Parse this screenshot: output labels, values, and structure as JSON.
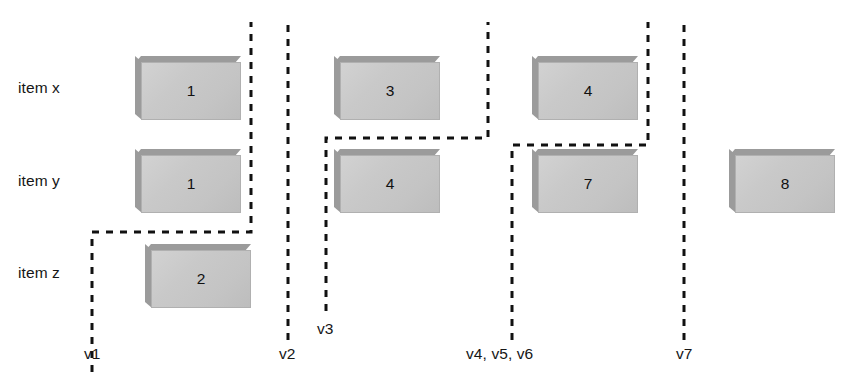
{
  "diagram": {
    "type": "version-timeline",
    "width": 857,
    "height": 387,
    "background_color": "#ffffff",
    "box_fill_color": "#c9c9c9",
    "box_shadow_color": "#9b9b9b",
    "dash_color": "#111111",
    "text_color": "#161616"
  },
  "rows": [
    {
      "id": "x",
      "label": "item x",
      "label_x": 18,
      "label_y": 79,
      "box_top": 56
    },
    {
      "id": "y",
      "label": "item y",
      "label_x": 18,
      "label_y": 172,
      "box_top": 149
    },
    {
      "id": "z",
      "label": "item z",
      "label_x": 18,
      "label_y": 264,
      "box_top": 244
    }
  ],
  "boxes": [
    {
      "row": "x",
      "value": "1",
      "x": 135,
      "y": 56
    },
    {
      "row": "x",
      "value": "3",
      "x": 334,
      "y": 56
    },
    {
      "row": "x",
      "value": "4",
      "x": 532,
      "y": 56
    },
    {
      "row": "y",
      "value": "1",
      "x": 135,
      "y": 149
    },
    {
      "row": "y",
      "value": "4",
      "x": 334,
      "y": 149
    },
    {
      "row": "y",
      "value": "7",
      "x": 532,
      "y": 149
    },
    {
      "row": "y",
      "value": "8",
      "x": 729,
      "y": 149
    },
    {
      "row": "z",
      "value": "2",
      "x": 145,
      "y": 244
    }
  ],
  "version_lines": [
    {
      "id": "v1",
      "label": "v1",
      "label_x": 84,
      "label_y": 345,
      "path": "M 92 372 L 92 232 L 251 232 L 251 22"
    },
    {
      "id": "v2",
      "label": "v2",
      "label_x": 279,
      "label_y": 345,
      "path": "M 288 340 L 288 22"
    },
    {
      "id": "v3",
      "label": "v3",
      "label_x": 317,
      "label_y": 320,
      "path": "M 326 311 L 326 138 L 488 138 L 488 22"
    },
    {
      "id": "v456",
      "label": "v4, v5, v6",
      "label_x": 466,
      "label_y": 345,
      "path": "M 512 340 L 512 145 L 648 145 L 648 22"
    },
    {
      "id": "v7",
      "label": "v7",
      "label_x": 676,
      "label_y": 345,
      "path": "M 684 340 L 684 22"
    }
  ]
}
